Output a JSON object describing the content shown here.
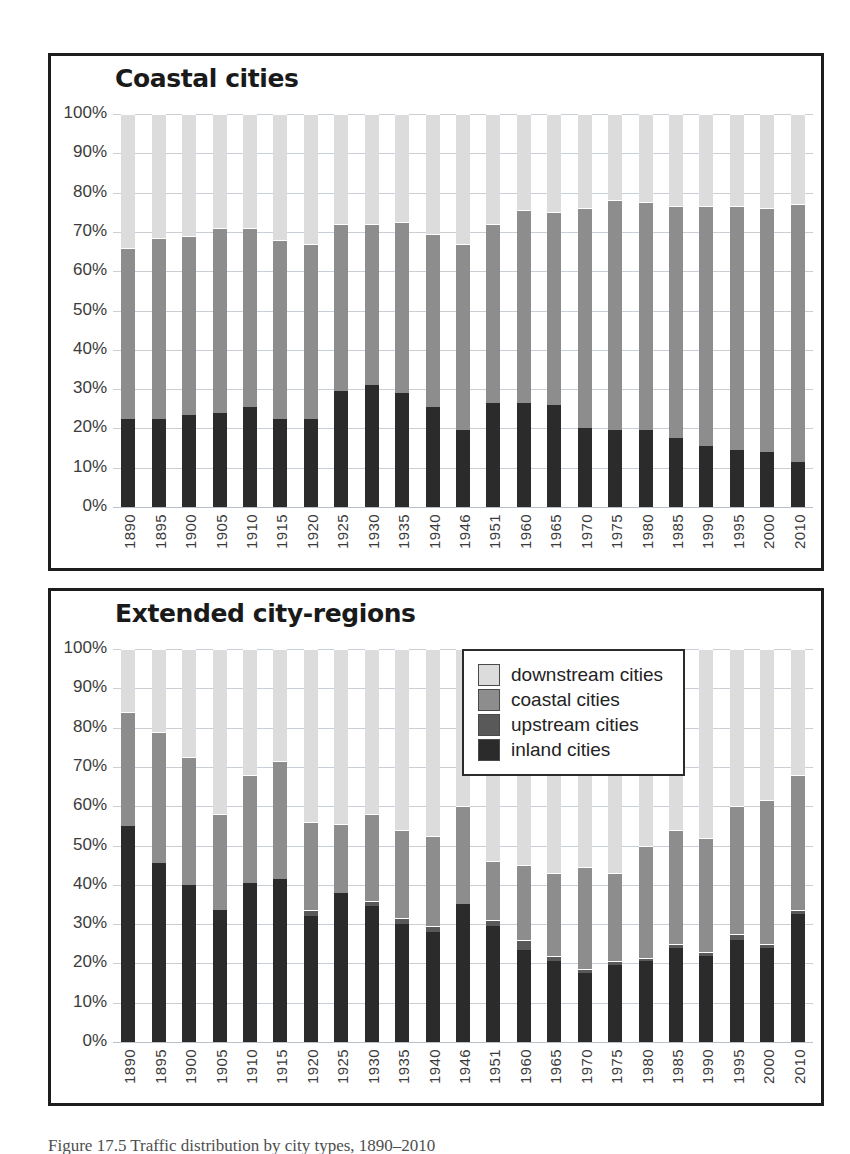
{
  "figure": {
    "caption": "Figure 17.5 Traffic distribution by city types, 1890–2010"
  },
  "legend": {
    "position": "inside-top-right-of-lower-panel",
    "items": [
      {
        "label": "downstream cities",
        "color": "#dcdcdc",
        "key": "downstream"
      },
      {
        "label": "coastal cities",
        "color": "#8d8d8d",
        "key": "coastal"
      },
      {
        "label": "upstream cities",
        "color": "#595959",
        "key": "upstream"
      },
      {
        "label": "inland cities",
        "color": "#2b2b2b",
        "key": "inland"
      }
    ]
  },
  "yaxis": {
    "ticks": [
      "100%",
      "90%",
      "80%",
      "70%",
      "60%",
      "50%",
      "40%",
      "30%",
      "20%",
      "10%",
      "0%"
    ],
    "min": 0,
    "max": 100
  },
  "chart_data": [
    {
      "id": "coastal-cities",
      "type": "bar",
      "stacked": true,
      "title": "Coastal cities",
      "xlabel": "",
      "ylabel": "",
      "ylim": [
        0,
        100
      ],
      "grid": true,
      "legend_position": "none",
      "categories": [
        "1890",
        "1895",
        "1900",
        "1905",
        "1910",
        "1915",
        "1920",
        "1925",
        "1930",
        "1935",
        "1940",
        "1946",
        "1951",
        "1960",
        "1965",
        "1970",
        "1975",
        "1980",
        "1985",
        "1990",
        "1995",
        "2000",
        "2010"
      ],
      "series": [
        {
          "name": "inland cities",
          "color": "#2b2b2b",
          "values": [
            22.5,
            22.5,
            23.5,
            24.0,
            25.5,
            22.5,
            22.5,
            29.5,
            31.0,
            29.0,
            25.5,
            19.5,
            26.5,
            26.5,
            26.0,
            20.0,
            19.5,
            19.5,
            17.5,
            15.5,
            14.5,
            14.0,
            11.5
          ]
        },
        {
          "name": "upstream cities",
          "color": "#595959",
          "values": [
            0,
            0,
            0,
            0,
            0,
            0,
            0,
            0,
            0,
            0,
            0,
            0,
            0,
            0,
            0,
            0,
            0,
            0,
            0,
            0,
            0,
            0,
            0
          ]
        },
        {
          "name": "coastal cities",
          "color": "#8d8d8d",
          "values": [
            43.5,
            46.0,
            45.5,
            47.0,
            45.5,
            45.5,
            44.5,
            42.5,
            41.0,
            43.5,
            44.0,
            47.5,
            45.5,
            49.0,
            49.0,
            56.0,
            58.5,
            58.0,
            59.0,
            61.0,
            62.0,
            62.0,
            65.5
          ]
        },
        {
          "name": "downstream cities",
          "color": "#dcdcdc",
          "values": [
            34.0,
            31.5,
            31.0,
            29.0,
            29.0,
            32.0,
            33.0,
            28.0,
            28.0,
            27.5,
            30.5,
            33.0,
            28.0,
            24.5,
            25.0,
            24.0,
            22.0,
            22.5,
            23.5,
            23.5,
            23.5,
            24.0,
            23.0
          ]
        }
      ],
      "stack_tops": {
        "inland": [
          22.5,
          22.5,
          23.5,
          24.0,
          25.5,
          22.5,
          22.5,
          29.5,
          31.0,
          29.0,
          25.5,
          19.5,
          26.5,
          26.5,
          26.0,
          20.0,
          19.5,
          19.5,
          17.5,
          15.5,
          14.5,
          14.0,
          11.5
        ],
        "coastal": [
          66.0,
          68.5,
          69.0,
          71.0,
          71.0,
          68.0,
          67.0,
          72.0,
          72.0,
          72.5,
          69.5,
          67.0,
          72.0,
          75.5,
          75.0,
          76.0,
          78.0,
          77.5,
          76.5,
          76.5,
          76.5,
          76.0,
          77.0
        ]
      }
    },
    {
      "id": "extended-city-regions",
      "type": "bar",
      "stacked": true,
      "title": "Extended city-regions",
      "xlabel": "",
      "ylabel": "",
      "ylim": [
        0,
        100
      ],
      "grid": true,
      "legend_position": "top-right-inside",
      "categories": [
        "1890",
        "1895",
        "1900",
        "1905",
        "1910",
        "1915",
        "1920",
        "1925",
        "1930",
        "1935",
        "1940",
        "1946",
        "1951",
        "1960",
        "1965",
        "1970",
        "1975",
        "1980",
        "1985",
        "1990",
        "1995",
        "2000",
        "2010"
      ],
      "series": [
        {
          "name": "inland cities",
          "color": "#2b2b2b",
          "values": [
            55.0,
            45.5,
            40.0,
            33.5,
            40.5,
            41.5,
            32.0,
            38.0,
            34.5,
            30.0,
            28.0,
            35.0,
            29.5,
            23.5,
            20.5,
            17.5,
            19.5,
            20.5,
            24.0,
            22.0,
            26.0,
            24.0,
            32.5
          ]
        },
        {
          "name": "upstream cities",
          "color": "#595959",
          "values": [
            0,
            0,
            0,
            0,
            0,
            0,
            1.5,
            0,
            1.5,
            1.5,
            1.5,
            0,
            1.5,
            2.5,
            1.5,
            1.0,
            1.0,
            1.0,
            1.0,
            1.0,
            1.5,
            1.0,
            1.0
          ]
        },
        {
          "name": "coastal cities",
          "color": "#8d8d8d",
          "values": [
            29.0,
            33.5,
            32.5,
            24.5,
            27.5,
            30.0,
            22.5,
            17.5,
            22.0,
            22.5,
            23.0,
            25.0,
            15.0,
            19.0,
            21.0,
            26.0,
            22.5,
            28.5,
            29.0,
            29.0,
            32.5,
            36.5,
            34.5
          ]
        },
        {
          "name": "downstream cities",
          "color": "#dcdcdc",
          "values": [
            16.0,
            21.0,
            27.5,
            42.0,
            32.0,
            28.5,
            44.0,
            44.5,
            42.0,
            46.0,
            47.5,
            40.0,
            54.0,
            55.0,
            57.0,
            55.5,
            57.0,
            50.0,
            46.0,
            48.0,
            40.0,
            38.5,
            32.0
          ]
        }
      ],
      "stack_tops": {
        "inland": [
          55.0,
          45.5,
          40.0,
          33.5,
          40.5,
          41.5,
          32.0,
          38.0,
          34.5,
          30.0,
          28.0,
          35.0,
          29.5,
          23.5,
          20.5,
          17.5,
          19.5,
          20.5,
          24.0,
          22.0,
          26.0,
          24.0,
          32.5
        ],
        "upstream": [
          55.0,
          45.5,
          40.0,
          33.5,
          40.5,
          41.5,
          33.5,
          38.0,
          36.0,
          31.5,
          29.5,
          35.0,
          31.0,
          26.0,
          22.0,
          18.5,
          20.5,
          21.5,
          25.0,
          23.0,
          27.5,
          25.0,
          33.5
        ],
        "coastal": [
          84.0,
          79.0,
          72.5,
          58.0,
          68.0,
          71.5,
          56.0,
          55.5,
          58.0,
          54.0,
          52.5,
          60.0,
          46.0,
          45.0,
          43.0,
          44.5,
          43.0,
          50.0,
          54.0,
          52.0,
          60.0,
          61.5,
          68.0
        ]
      }
    }
  ]
}
